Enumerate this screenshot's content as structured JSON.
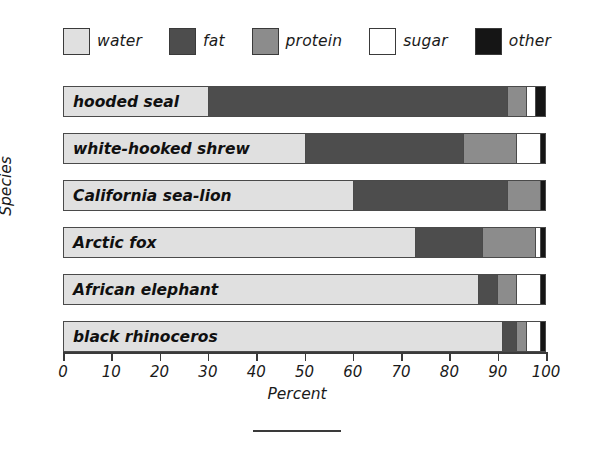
{
  "chart_data": {
    "type": "bar",
    "orientation": "horizontal",
    "stacked": true,
    "title": "",
    "xlabel": "Percent",
    "ylabel": "Species",
    "xlim": [
      0,
      100
    ],
    "xticks": [
      0,
      10,
      20,
      30,
      40,
      50,
      60,
      70,
      80,
      90,
      100
    ],
    "xtick_labels": [
      "0",
      "10",
      "20",
      "30",
      "40",
      "50",
      "60",
      "70",
      "80",
      "90",
      "100"
    ],
    "grid": false,
    "legend_position": "top",
    "categories": [
      "hooded seal",
      "white-hooked shrew",
      "California sea-lion",
      "Arctic fox",
      "African elephant",
      "black rhinoceros"
    ],
    "series": [
      {
        "name": "water",
        "color": "#e0e0e0",
        "values": [
          30,
          50,
          60,
          73,
          86,
          91
        ]
      },
      {
        "name": "fat",
        "color": "#4d4d4d",
        "values": [
          62,
          33,
          32,
          14,
          4,
          3
        ]
      },
      {
        "name": "protein",
        "color": "#8c8c8c",
        "values": [
          4,
          11,
          7,
          11,
          4,
          2
        ]
      },
      {
        "name": "sugar",
        "color": "#ffffff",
        "values": [
          2,
          5,
          0,
          1,
          5,
          3
        ]
      },
      {
        "name": "other",
        "color": "#151515",
        "values": [
          2,
          1,
          1,
          1,
          1,
          1
        ]
      }
    ]
  },
  "legend": {
    "items": [
      {
        "label": "water",
        "color": "#e0e0e0",
        "icon": "legend-swatch-icon"
      },
      {
        "label": "fat",
        "color": "#4d4d4d",
        "icon": "legend-swatch-icon"
      },
      {
        "label": "protein",
        "color": "#8c8c8c",
        "icon": "legend-swatch-icon"
      },
      {
        "label": "sugar",
        "color": "#ffffff",
        "icon": "legend-swatch-icon"
      },
      {
        "label": "other",
        "color": "#151515",
        "icon": "legend-swatch-icon"
      }
    ]
  },
  "axes": {
    "x_title": "Percent",
    "y_title": "Species"
  }
}
